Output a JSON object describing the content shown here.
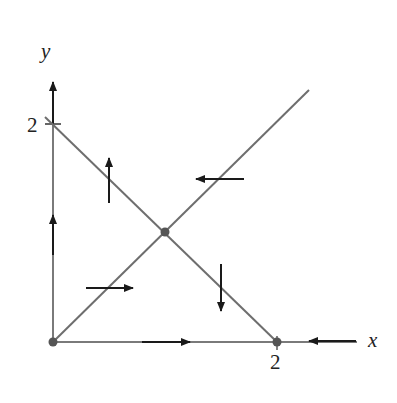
{
  "diagram": {
    "type": "phase-plane",
    "axes": {
      "x_label": "x",
      "y_label": "y",
      "x_tick_label": "2",
      "y_tick_label": "2"
    },
    "lines": [
      {
        "name": "nullcline-diagonal",
        "description": "y = x"
      },
      {
        "name": "nullcline-antidiagonal",
        "description": "x + y = 2"
      }
    ],
    "equilibria": [
      {
        "name": "origin",
        "x": 0,
        "y": 0
      },
      {
        "name": "center",
        "x": 1,
        "y": 1
      },
      {
        "name": "x-intercept",
        "x": 2,
        "y": 0
      }
    ],
    "arrows": [
      {
        "name": "arrow-up-left-region",
        "direction": "up"
      },
      {
        "name": "arrow-left-top-region",
        "direction": "left"
      },
      {
        "name": "arrow-right-bottom-left-region",
        "direction": "right"
      },
      {
        "name": "arrow-down-right-region",
        "direction": "down"
      },
      {
        "name": "arrow-up-on-y-axis",
        "direction": "up"
      },
      {
        "name": "arrow-right-on-x-axis",
        "direction": "right"
      },
      {
        "name": "arrow-left-on-x-axis-beyond-2",
        "direction": "left"
      }
    ],
    "colors": {
      "line": "#6e6e6e",
      "arrow": "#1a1a1a",
      "point": "#555555"
    }
  }
}
